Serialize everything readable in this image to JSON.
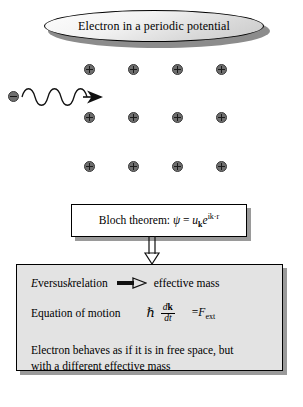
{
  "figure": {
    "title": {
      "text": "Electron in a periodic potential",
      "shape": "ellipse"
    },
    "lattice": {
      "ion_symbol": "+",
      "rows": 3,
      "columns": 4,
      "positions": [
        {
          "x": 84,
          "y": 6
        },
        {
          "x": 128,
          "y": 6
        },
        {
          "x": 172,
          "y": 6
        },
        {
          "x": 216,
          "y": 6
        },
        {
          "x": 84,
          "y": 54
        },
        {
          "x": 128,
          "y": 54
        },
        {
          "x": 172,
          "y": 54
        },
        {
          "x": 216,
          "y": 54
        },
        {
          "x": 84,
          "y": 103
        },
        {
          "x": 128,
          "y": 103
        },
        {
          "x": 172,
          "y": 103
        },
        {
          "x": 216,
          "y": 103
        }
      ]
    },
    "electron": {
      "symbol": "-",
      "label": "incident-electron-wave"
    },
    "bloch_box": {
      "label": "Bloch theorem:",
      "formula_psi": "ψ",
      "formula_equals": " = ",
      "formula_u": "u",
      "formula_u_sub": "k",
      "formula_e": "e",
      "formula_exp": "ik·r"
    },
    "bottom_box": {
      "relation_text_left": "E",
      "relation_text_mid": " versus ",
      "relation_text_k": "k",
      "relation_text_rest": " relation",
      "relation_result": "effective mass",
      "eom_label": "Equation of motion",
      "eom_hbar": "ℏ",
      "eom_numerator_d": "d",
      "eom_numerator_k": "k",
      "eom_denominator": "dt",
      "eom_equals": "=",
      "eom_force": "F",
      "eom_force_sub": "ext",
      "summary_line1": "Electron behaves as if it is in free space, but",
      "summary_line2": "with a different effective mass"
    },
    "colors": {
      "ion_fill": "#6e6e6e",
      "box_border": "#000000",
      "shadow": "#9a9a9a",
      "bottom_box_fill": "#e3e3e3",
      "background": "#ffffff"
    }
  }
}
